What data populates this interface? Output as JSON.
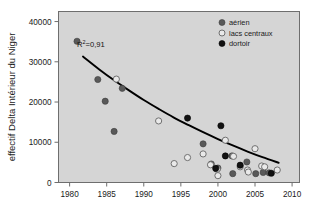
{
  "chart_data": {
    "type": "scatter",
    "title": "",
    "xlabel": "",
    "ylabel": "effectif Delta Intérieur du Niger",
    "xlim": [
      1978.5,
      2011.0
    ],
    "ylim": [
      0,
      42500
    ],
    "xticks": [
      1980,
      1985,
      1990,
      1995,
      2000,
      2005,
      2010
    ],
    "xticklabels": [
      "1980",
      "1985",
      "1990",
      "1995",
      "2000",
      "2005",
      "2010"
    ],
    "yticks": [
      0,
      10000,
      20000,
      30000,
      40000
    ],
    "yticklabels": [
      "0",
      "10000",
      "20000",
      "30000",
      "40000"
    ],
    "grid": false,
    "legend_position": "top-right",
    "annotations": [
      {
        "name": "r-squared",
        "text": "R",
        "sup": "2",
        "text2": "=0,91",
        "x": 1982.0,
        "y": 32200
      }
    ],
    "series": [
      {
        "name": "aérien",
        "marker": "filled-circle",
        "color": "#595959",
        "edge": "#3d3d3d",
        "points": [
          {
            "x": 1981.0,
            "y": 35100
          },
          {
            "x": 1983.8,
            "y": 25600
          },
          {
            "x": 1984.8,
            "y": 20200
          },
          {
            "x": 1986.0,
            "y": 12700
          },
          {
            "x": 1987.1,
            "y": 23400
          },
          {
            "x": 1998.0,
            "y": 9600
          },
          {
            "x": 1999.1,
            "y": 4600
          },
          {
            "x": 2000.0,
            "y": 3600
          },
          {
            "x": 2001.9,
            "y": 6600
          },
          {
            "x": 2003.9,
            "y": 5100
          },
          {
            "x": 2005.1,
            "y": 2200
          },
          {
            "x": 2006.1,
            "y": 2500
          },
          {
            "x": 2006.9,
            "y": 2400
          },
          {
            "x": 2002.0,
            "y": 2200
          }
        ]
      },
      {
        "name": "lacs centraux",
        "marker": "open-circle",
        "color": "#e9e9e9",
        "edge": "#707070",
        "points": [
          {
            "x": 1986.3,
            "y": 25700
          },
          {
            "x": 1992.0,
            "y": 15300
          },
          {
            "x": 1994.1,
            "y": 4700
          },
          {
            "x": 1995.9,
            "y": 6200
          },
          {
            "x": 1998.0,
            "y": 7100
          },
          {
            "x": 1999.0,
            "y": 4400
          },
          {
            "x": 2000.0,
            "y": 1700
          },
          {
            "x": 2001.0,
            "y": 10500
          },
          {
            "x": 2002.1,
            "y": 6500
          },
          {
            "x": 2003.0,
            "y": 3900
          },
          {
            "x": 2004.0,
            "y": 3100
          },
          {
            "x": 2005.0,
            "y": 8400
          },
          {
            "x": 2005.9,
            "y": 4100
          },
          {
            "x": 2006.3,
            "y": 3900
          },
          {
            "x": 2008.0,
            "y": 3100
          },
          {
            "x": 2004.1,
            "y": 2600
          },
          {
            "x": 1999.9,
            "y": 3300
          }
        ]
      },
      {
        "name": "dortoir",
        "marker": "filled-circle",
        "color": "#121212",
        "edge": "#000000",
        "points": [
          {
            "x": 1995.9,
            "y": 16000
          },
          {
            "x": 2000.4,
            "y": 14100
          },
          {
            "x": 2001.0,
            "y": 6600
          },
          {
            "x": 1999.7,
            "y": 3500
          },
          {
            "x": 2003.0,
            "y": 4300
          },
          {
            "x": 2007.2,
            "y": 2300
          }
        ]
      }
    ],
    "trend": {
      "name": "exponential-fit",
      "color": "#000000",
      "points": [
        {
          "x": 1981.8,
          "y": 31300
        },
        {
          "x": 1984.0,
          "y": 28100
        },
        {
          "x": 1986.0,
          "y": 25400
        },
        {
          "x": 1988.0,
          "y": 22900
        },
        {
          "x": 1990.0,
          "y": 20500
        },
        {
          "x": 1992.0,
          "y": 18300
        },
        {
          "x": 1994.0,
          "y": 16200
        },
        {
          "x": 1996.0,
          "y": 14300
        },
        {
          "x": 1998.0,
          "y": 12500
        },
        {
          "x": 2000.0,
          "y": 10800
        },
        {
          "x": 2002.0,
          "y": 9200
        },
        {
          "x": 2004.0,
          "y": 7700
        },
        {
          "x": 2006.0,
          "y": 6300
        },
        {
          "x": 2008.2,
          "y": 4900
        }
      ]
    },
    "legend": [
      {
        "label": "aérien",
        "marker": "filled-circle",
        "color": "#595959"
      },
      {
        "label": "lacs centraux",
        "marker": "open-circle",
        "color": "#e9e9e9"
      },
      {
        "label": "dortoir",
        "marker": "filled-circle",
        "color": "#121212"
      }
    ],
    "colors": {
      "plot_background": "#d5d5d5",
      "frame": "#6e6e6e",
      "text": "#1a1a1a",
      "trend_line": "#000000"
    }
  }
}
